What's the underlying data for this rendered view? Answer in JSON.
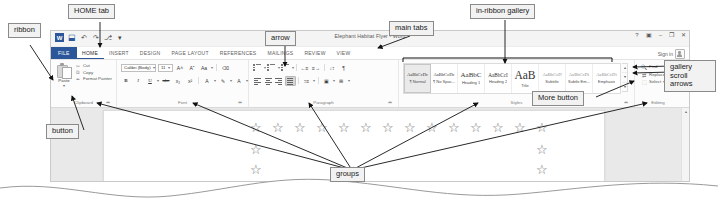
{
  "window": {
    "title": "Elephant Habitat Flyer - Word",
    "quick_access": [
      {
        "name": "word-logo",
        "glyph": "W"
      },
      {
        "name": "save-icon",
        "glyph": "⬓"
      },
      {
        "name": "undo-icon",
        "glyph": "↶"
      },
      {
        "name": "redo-icon",
        "glyph": "↷"
      },
      {
        "name": "touch-mode-icon",
        "glyph": "⎇"
      },
      {
        "name": "customize-qat-icon",
        "glyph": "▾"
      }
    ],
    "controls": [
      {
        "name": "help-button",
        "glyph": "?"
      },
      {
        "name": "ribbon-display-options-button",
        "glyph": "▣"
      },
      {
        "name": "minimize-button",
        "glyph": "–"
      },
      {
        "name": "restore-button",
        "glyph": "❐"
      },
      {
        "name": "close-button",
        "glyph": "✕"
      }
    ],
    "sign_in": "Sign in"
  },
  "tabs": [
    {
      "label": "FILE",
      "kind": "file"
    },
    {
      "label": "HOME",
      "kind": "active"
    },
    {
      "label": "INSERT",
      "kind": "normal"
    },
    {
      "label": "DESIGN",
      "kind": "normal"
    },
    {
      "label": "PAGE LAYOUT",
      "kind": "normal"
    },
    {
      "label": "REFERENCES",
      "kind": "normal"
    },
    {
      "label": "MAILINGS",
      "kind": "normal"
    },
    {
      "label": "REVIEW",
      "kind": "normal"
    },
    {
      "label": "VIEW",
      "kind": "normal"
    }
  ],
  "groups": {
    "clipboard": {
      "label": "Clipboard",
      "dialog_launcher": "⬌",
      "paste": {
        "label": "Paste",
        "caret": "▾"
      },
      "commands": [
        {
          "label": "Cut",
          "icon": "✂"
        },
        {
          "label": "Copy",
          "icon": "⧉"
        },
        {
          "label": "Format Painter",
          "icon": "✒"
        }
      ]
    },
    "font": {
      "label": "Font",
      "dialog_launcher": "⬌",
      "font_name": "Calibri (Body)",
      "font_size": "11",
      "caret": "▾",
      "row1": [
        {
          "name": "grow-font-button",
          "glyph": "A˄"
        },
        {
          "name": "shrink-font-button",
          "glyph": "Aˇ"
        },
        {
          "name": "change-case-button",
          "glyph": "Aa"
        },
        {
          "name": "clear-formatting-button",
          "glyph": "⌫"
        }
      ],
      "row2": [
        {
          "name": "bold-button",
          "glyph": "B"
        },
        {
          "name": "italic-button",
          "glyph": "I"
        },
        {
          "name": "underline-button",
          "glyph": "U"
        },
        {
          "name": "strikethrough-button",
          "glyph": "abc"
        },
        {
          "name": "subscript-button",
          "glyph": "x₂"
        },
        {
          "name": "superscript-button",
          "glyph": "x²"
        },
        {
          "name": "text-effects-button",
          "glyph": "A"
        },
        {
          "name": "text-highlight-color-button",
          "glyph": "✎"
        },
        {
          "name": "font-color-button",
          "glyph": "A"
        }
      ]
    },
    "paragraph": {
      "label": "Paragraph",
      "dialog_launcher": "⬌",
      "row1": [
        {
          "name": "bullets-button",
          "glyph": "•"
        },
        {
          "name": "numbering-button",
          "glyph": "1."
        },
        {
          "name": "multilevel-list-button",
          "glyph": "≡"
        },
        {
          "name": "decrease-indent-button",
          "glyph": "←≡"
        },
        {
          "name": "increase-indent-button",
          "glyph": "≡→"
        },
        {
          "name": "sort-button",
          "glyph": "↓↕"
        },
        {
          "name": "show-formatting-marks-button",
          "glyph": "¶"
        }
      ],
      "row2": [
        {
          "name": "align-left-button",
          "glyph": "≡"
        },
        {
          "name": "center-button",
          "glyph": "≡"
        },
        {
          "name": "align-right-button",
          "glyph": "≡"
        },
        {
          "name": "justify-button",
          "glyph": "≡"
        },
        {
          "name": "line-spacing-button",
          "glyph": "↕≡"
        },
        {
          "name": "shading-button",
          "glyph": "▣"
        },
        {
          "name": "borders-button",
          "glyph": "⊞"
        }
      ]
    },
    "styles": {
      "label": "Styles",
      "dialog_launcher": "⬌",
      "items": [
        {
          "preview": "AaBbCcDc",
          "name": "¶ Normal",
          "size": "xs",
          "selected": true
        },
        {
          "preview": "AaBbCcDc",
          "name": "¶ No Spac...",
          "size": "xs",
          "selected": false
        },
        {
          "preview": "AaBbC",
          "name": "Heading 1",
          "size": "md",
          "selected": false
        },
        {
          "preview": "AaBbCcI",
          "name": "Heading 2",
          "size": "sm",
          "selected": false
        },
        {
          "preview": "AaB",
          "name": "Title",
          "size": "lg",
          "selected": false
        },
        {
          "preview": "AaBbCcD",
          "name": "Subtitle",
          "size": "xs",
          "tone": "gray",
          "selected": false
        },
        {
          "preview": "AaBbCcDi",
          "name": "Subtle Em...",
          "size": "xs",
          "tone": "gray",
          "selected": false
        },
        {
          "preview": "AaBbCcDi",
          "name": "Emphasis",
          "size": "xs",
          "tone": "gray",
          "selected": false
        }
      ],
      "scroll_arrows": [
        {
          "name": "gallery-scroll-up-button",
          "glyph": "▴"
        },
        {
          "name": "gallery-scroll-down-button",
          "glyph": "▾"
        },
        {
          "name": "gallery-more-button",
          "glyph": "▾"
        }
      ]
    },
    "editing": {
      "label": "Editing",
      "commands": [
        {
          "label": "Find",
          "icon": "🔍",
          "caret": ""
        },
        {
          "label": "Replace",
          "icon": "⇄",
          "caret": ""
        },
        {
          "label": "Select",
          "icon": "⬚",
          "caret": "▾"
        }
      ]
    }
  },
  "document": {
    "scroll_up": "▴",
    "scroll_down": "▾",
    "star_glyph": "☆"
  },
  "callouts": [
    {
      "id": "ribbon",
      "text": "ribbon"
    },
    {
      "id": "home-tab",
      "text": "HOME tab"
    },
    {
      "id": "arrow",
      "text": "arrow"
    },
    {
      "id": "main-tabs",
      "text": "main tabs"
    },
    {
      "id": "in-ribbon-gallery",
      "text": "in-ribbon gallery"
    },
    {
      "id": "gallery-scroll-arrows",
      "text": "gallery scroll arrows"
    },
    {
      "id": "more-button",
      "text": "More button"
    },
    {
      "id": "button",
      "text": "button"
    },
    {
      "id": "groups",
      "text": "groups"
    }
  ]
}
